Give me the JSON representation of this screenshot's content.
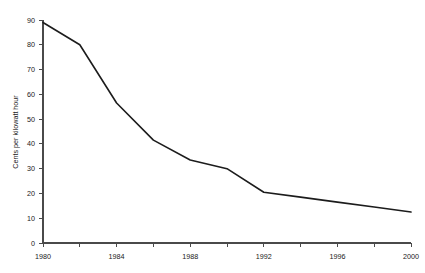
{
  "chart_data": {
    "type": "line",
    "title": "",
    "xlabel": "",
    "ylabel": "Cents per kilowatt hour",
    "xlim": [
      1980,
      2000
    ],
    "ylim": [
      0,
      90
    ],
    "grid": false,
    "legend": "none",
    "x_tick_labels": [
      "1980",
      "1984",
      "1988",
      "1992",
      "1996",
      "2000"
    ],
    "x_tick_values": [
      1980,
      1984,
      1988,
      1992,
      1996,
      2000
    ],
    "x_minor_tick_values": [
      1982,
      1986,
      1990,
      1994,
      1998
    ],
    "y_tick_labels": [
      "0",
      "10",
      "20",
      "30",
      "40",
      "50",
      "60",
      "70",
      "80",
      "90"
    ],
    "y_tick_values": [
      0,
      10,
      20,
      30,
      40,
      50,
      60,
      70,
      80,
      90
    ],
    "series": [
      {
        "name": "Cents per kilowatt hour",
        "color": "#1c1c1c",
        "x": [
          1980,
          1982,
          1984,
          1986,
          1988,
          1990,
          1992,
          1994,
          1996,
          1998,
          2000
        ],
        "values": [
          89,
          80,
          56.5,
          41.5,
          33.5,
          30,
          20.5,
          18.5,
          16.5,
          14.5,
          12.5
        ]
      }
    ]
  },
  "colors": {
    "line": "#1c1c1c",
    "axis": "#4a4a4a",
    "text": "#1a1a1a",
    "background": "#ffffff"
  }
}
